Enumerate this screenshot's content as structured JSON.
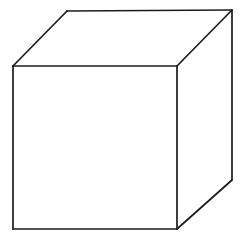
{
  "figure": {
    "type": "line-drawing",
    "canvas": {
      "width": 246,
      "height": 241,
      "background_color": "#ffffff"
    },
    "style": {
      "stroke_color": "#1c1c1c",
      "stroke_width": 1.7,
      "fill_color": "#ffffff",
      "line_style": "solid"
    },
    "projection": "oblique-cabinet",
    "vertices": {
      "front_top_left": [
        13,
        66
      ],
      "front_top_right": [
        177,
        66
      ],
      "front_bottom_right": [
        177,
        229
      ],
      "front_bottom_left": [
        13,
        229
      ],
      "back_top_left": [
        67,
        11
      ],
      "back_top_right": [
        232,
        10
      ],
      "back_bottom_right": [
        232,
        180
      ]
    },
    "faces": [
      {
        "name": "front-face",
        "points": "13,66 177,66 177,229 13,229",
        "visible": true
      },
      {
        "name": "top-face",
        "points": "13,66 67,11 232,10 177,66",
        "visible": true
      },
      {
        "name": "right-face",
        "points": "177,66 232,10 232,180 177,229",
        "visible": true
      }
    ],
    "edges": [
      {
        "name": "front-top-edge",
        "from": [
          13,
          66
        ],
        "to": [
          177,
          66
        ]
      },
      {
        "name": "front-right-edge",
        "from": [
          177,
          66
        ],
        "to": [
          177,
          229
        ]
      },
      {
        "name": "front-bottom-edge",
        "from": [
          177,
          229
        ],
        "to": [
          13,
          229
        ]
      },
      {
        "name": "front-left-edge",
        "from": [
          13,
          229
        ],
        "to": [
          13,
          66
        ]
      },
      {
        "name": "top-left-receding-edge",
        "from": [
          13,
          66
        ],
        "to": [
          67,
          11
        ]
      },
      {
        "name": "back-top-edge",
        "from": [
          67,
          11
        ],
        "to": [
          232,
          10
        ]
      },
      {
        "name": "top-right-receding-edge",
        "from": [
          232,
          10
        ],
        "to": [
          177,
          66
        ]
      },
      {
        "name": "back-right-vertical-edge",
        "from": [
          232,
          10
        ],
        "to": [
          232,
          180
        ]
      },
      {
        "name": "bottom-right-receding-edge",
        "from": [
          232,
          180
        ],
        "to": [
          177,
          229
        ]
      }
    ]
  }
}
